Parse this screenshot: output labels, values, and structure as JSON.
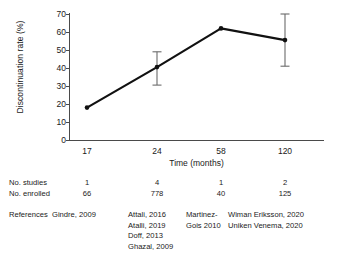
{
  "chart_data": {
    "type": "line",
    "title": "",
    "xlabel": "Time (months)",
    "ylabel": "Discontinuation rate (%)",
    "categories": [
      "17",
      "24",
      "58",
      "120"
    ],
    "x": [
      17,
      24,
      58,
      120
    ],
    "values": [
      18,
      40.5,
      62,
      55.5
    ],
    "errors_low": [
      null,
      30.5,
      null,
      41
    ],
    "errors_high": [
      null,
      49,
      null,
      70
    ],
    "ylim": [
      0,
      70
    ],
    "yticks": [
      "0",
      "10",
      "20",
      "30",
      "40",
      "50",
      "60",
      "70"
    ],
    "ytick_values": [
      0,
      10,
      20,
      30,
      40,
      50,
      60,
      70
    ],
    "grid": false,
    "legend": "none",
    "marker": "filled-circle",
    "line_color": "#111111",
    "errorbar_color": "#6b6b6b"
  },
  "table": {
    "rows": [
      {
        "label": "No. studies",
        "cells": [
          "1",
          "4",
          "1",
          "2"
        ]
      },
      {
        "label": "No. enrolled",
        "cells": [
          "66",
          "778",
          "40",
          "125"
        ]
      }
    ],
    "references": {
      "label": "References",
      "columns": [
        [
          "Gindre, 2009"
        ],
        [
          "Attali, 2016",
          "Atalli, 2019",
          "Doff, 2013",
          "Ghazal, 2009"
        ],
        [
          "Martinez-",
          "Gois 2010"
        ],
        [
          "Wiman Eriksson, 2020",
          "Uniken Venema, 2020"
        ]
      ]
    }
  }
}
